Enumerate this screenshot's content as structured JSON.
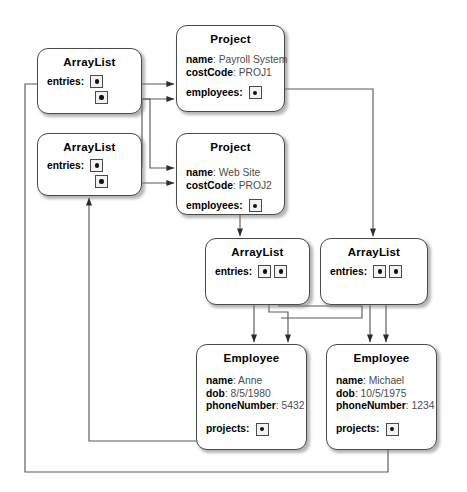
{
  "diagram": {
    "type": "object-diagram",
    "width": 467,
    "height": 492,
    "colors": {
      "background": "#ffffff",
      "box_border": "#4a4a4a",
      "box_fill": "#ffffff",
      "wire": "#5a5a5a",
      "key_text": "#000000",
      "value_text": "#4d4d4d",
      "slot_fill": "#f2f2f2",
      "dot": "#111111"
    }
  },
  "labels": {
    "entries": "entries:",
    "employees": "employees:",
    "projects": "projects:"
  },
  "objects": {
    "arraylist_projects_anne": {
      "type": "ArrayList",
      "ref_label": "entries:",
      "slot_count": 2
    },
    "arraylist_projects_michael": {
      "type": "ArrayList",
      "ref_label": "entries:",
      "slot_count": 2
    },
    "project_payroll": {
      "type": "Project",
      "fields": [
        {
          "key": "name",
          "value": "Payroll System"
        },
        {
          "key": "costCode",
          "value": "PROJ1"
        }
      ],
      "ref_label": "employees:",
      "slot_count": 1
    },
    "project_website": {
      "type": "Project",
      "fields": [
        {
          "key": "name",
          "value": "Web Site"
        },
        {
          "key": "costCode",
          "value": "PROJ2"
        }
      ],
      "ref_label": "employees:",
      "slot_count": 1
    },
    "arraylist_employees_website": {
      "type": "ArrayList",
      "ref_label": "entries:",
      "slot_count": 2
    },
    "arraylist_employees_payroll": {
      "type": "ArrayList",
      "ref_label": "entries:",
      "slot_count": 2
    },
    "employee_anne": {
      "type": "Employee",
      "fields": [
        {
          "key": "name",
          "value": "Anne"
        },
        {
          "key": "dob",
          "value": "8/5/1980"
        },
        {
          "key": "phoneNumber",
          "value": "5432"
        }
      ],
      "ref_label": "projects:",
      "slot_count": 1
    },
    "employee_michael": {
      "type": "Employee",
      "fields": [
        {
          "key": "name",
          "value": "Michael"
        },
        {
          "key": "dob",
          "value": "10/5/1975"
        },
        {
          "key": "phoneNumber",
          "value": "1234"
        }
      ],
      "ref_label": "projects:",
      "slot_count": 1
    }
  },
  "links": [
    {
      "from": "arraylist_projects_anne.slot0",
      "to": "project_payroll"
    },
    {
      "from": "arraylist_projects_anne.slot1",
      "to": "project_website"
    },
    {
      "from": "arraylist_projects_michael.slot0",
      "to": "project_website"
    },
    {
      "from": "arraylist_projects_michael.slot1",
      "to": "project_website"
    },
    {
      "from": "project_payroll.employees",
      "to": "arraylist_employees_payroll"
    },
    {
      "from": "project_website.employees",
      "to": "arraylist_employees_website"
    },
    {
      "from": "arraylist_employees_website.slot0",
      "to": "employee_anne"
    },
    {
      "from": "arraylist_employees_website.slot1",
      "to": "employee_anne"
    },
    {
      "from": "arraylist_employees_payroll.slot0",
      "to": "employee_michael"
    },
    {
      "from": "arraylist_employees_payroll.slot1",
      "to": "employee_michael"
    },
    {
      "from": "employee_anne.projects",
      "to": "arraylist_projects_michael"
    },
    {
      "from": "employee_michael.projects",
      "to": "arraylist_projects_anne"
    }
  ]
}
